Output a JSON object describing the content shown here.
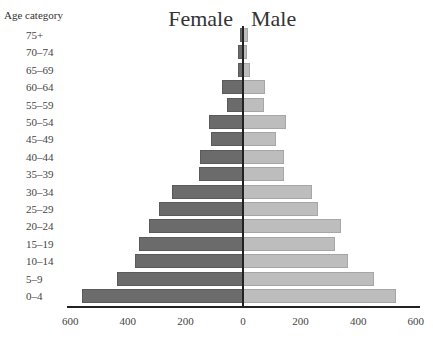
{
  "chart_data": {
    "type": "bar",
    "subtype": "population-pyramid",
    "title": "",
    "ylabel": "Age category",
    "xlabel": "",
    "left_label": "Female",
    "right_label": "Male",
    "categories": [
      "75+",
      "70–74",
      "65–69",
      "60–64",
      "55–59",
      "50–54",
      "45–49",
      "40–44",
      "35–39",
      "30–34",
      "25–29",
      "20–24",
      "15–19",
      "10–14",
      "5–9",
      "0–4"
    ],
    "series": [
      {
        "name": "Female",
        "color": "#6b6b6b",
        "values": [
          10,
          18,
          17,
          72,
          55,
          117,
          110,
          148,
          152,
          248,
          290,
          328,
          362,
          376,
          438,
          559
        ]
      },
      {
        "name": "Male",
        "color": "#bdbdbd",
        "values": [
          18,
          14,
          26,
          76,
          73,
          148,
          114,
          141,
          141,
          238,
          262,
          341,
          321,
          366,
          455,
          531
        ]
      }
    ],
    "xlim": [
      -600,
      600
    ],
    "xticks": [
      "600",
      "400",
      "200",
      "0",
      "200",
      "400",
      "600"
    ],
    "grid": false,
    "legend": "none"
  }
}
